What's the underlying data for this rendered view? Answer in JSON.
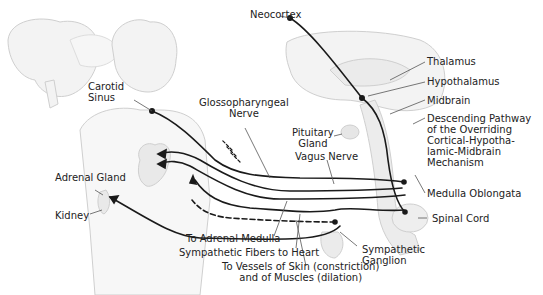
{
  "figure": {
    "type": "anatomical-diagram"
  },
  "labels": {
    "neocortex": "Neocortex",
    "thalamus": "Thalamus",
    "hypothalamus": "Hypothalamus",
    "midbrain": "Midbrain",
    "descending_pathway": [
      "Descending Pathway",
      "of the Overriding",
      "Cortical-Hypotha-",
      "lamic-Midbrain",
      "Mechanism"
    ],
    "medulla_oblongata": "Medulla Oblongata",
    "spinal_cord": "Spinal Cord",
    "pituitary_gland": [
      "Pituitary",
      "Gland"
    ],
    "vagus_nerve": "Vagus Nerve",
    "glossopharyngeal_nerve": [
      "Glossopharyngeal",
      "Nerve"
    ],
    "carotid_sinus": [
      "Carotid",
      "Sinus"
    ],
    "adrenal_gland": "Adrenal Gland",
    "kidney": "Kidney",
    "to_adrenal_medulla": "To Adrenal Medulla",
    "sympathetic_fibers_heart": "Sympathetic Fibers to Heart",
    "to_vessels": [
      "To Vessels of Skin (constriction)",
      "and of Muscles (dilation)"
    ],
    "sympathetic_ganglion": [
      "Sympathetic",
      "Ganglion"
    ]
  },
  "colors": {
    "line": "#1a1a1a",
    "sketch": "#c8c8c8",
    "sketch_fill": "#f0f0f0",
    "text": "#222222"
  }
}
